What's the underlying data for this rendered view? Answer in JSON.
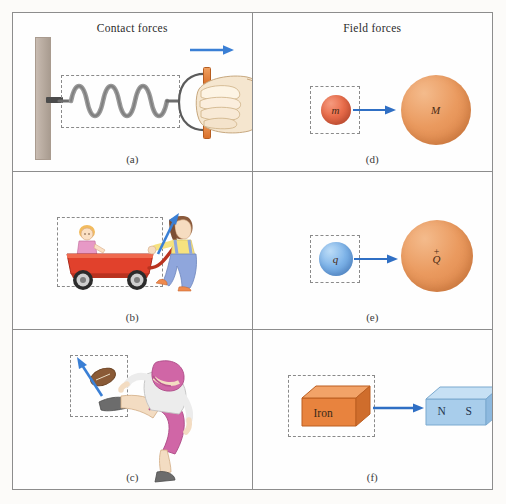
{
  "figure": {
    "columns": [
      {
        "title": "Contact forces"
      },
      {
        "title": "Field forces"
      }
    ]
  },
  "panels": [
    {
      "id": "a",
      "caption": "(a)",
      "column_title": "Contact forces",
      "scene": "hand pulling a spring attached to a wall",
      "arrow": {
        "direction": "right",
        "color": "#3a7fd5"
      },
      "dashed_box": true
    },
    {
      "id": "b",
      "caption": "(b)",
      "scene": "girl pulling a red wagon with a doll",
      "arrow": {
        "direction": "up-right",
        "color": "#3a7fd5"
      },
      "dashed_box": true
    },
    {
      "id": "c",
      "caption": "(c)",
      "scene": "football player kicking a football",
      "arrow": {
        "direction": "up-left",
        "color": "#3a7fd5"
      },
      "dashed_box": true
    },
    {
      "id": "d",
      "caption": "(d)",
      "column_title": "Field forces",
      "scene": "small mass attracted to large mass (gravitation)",
      "small_body": {
        "label": "m",
        "color": "#ea6e4c"
      },
      "large_body": {
        "label": "M",
        "color": "#ea9a5f"
      },
      "arrow": {
        "direction": "right",
        "color": "#2f6fc4"
      },
      "dashed_box": true
    },
    {
      "id": "e",
      "caption": "(e)",
      "scene": "small charge attracted to large positive charge (electrostatic)",
      "small_body": {
        "label": "q",
        "color": "#7eb4e9"
      },
      "large_body": {
        "label": "Q",
        "sign": "+",
        "color": "#ea9a5f"
      },
      "arrow": {
        "direction": "right",
        "color": "#2f6fc4"
      },
      "dashed_box": true
    },
    {
      "id": "f",
      "caption": "(f)",
      "scene": "iron block attracted to a bar magnet (magnetic)",
      "small_body": {
        "label": "Iron",
        "color": "#e8833e"
      },
      "large_body": {
        "label_north": "N",
        "label_south": "S",
        "color": "#a8cdeb"
      },
      "arrow": {
        "direction": "right",
        "color": "#2f6fc4"
      },
      "dashed_box": true
    }
  ],
  "colors": {
    "arrow_blue": "#3a7fd5",
    "field_arrow_blue": "#2f6fc4",
    "panel_border": "#8d8d8d",
    "dash_gray": "#8a8a8a",
    "page_background": "#fbfaf8"
  }
}
